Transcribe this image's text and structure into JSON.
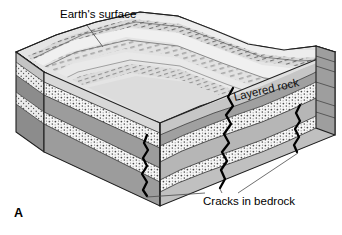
{
  "figure": {
    "panel_label": "A",
    "type": "geologic-block-diagram",
    "annotations": [
      {
        "name": "earths-surface",
        "text": "Earth's surface",
        "leader": "line from label down-right to ridged top surface"
      },
      {
        "name": "layered-rock",
        "text": "Layered rock",
        "leader": "none, placed on right block face, rotated with perspective"
      },
      {
        "name": "cracks-in-bedrock",
        "text": "Cracks in bedrock",
        "leader": "three thin lines fanning up to the three black cracks"
      }
    ],
    "colors": {
      "outline": "#1a1a1a",
      "crack": "#000000",
      "leader": "#4a4a4a",
      "top_surface_light": "#e8e8e8",
      "top_surface_shade": "#c9c9c9",
      "stipple_band": "#f4f4f4",
      "gray_band_front": "#9a9a9a",
      "gray_band_side": "#8a8a8a",
      "gray_band_right": "#b3b3b3",
      "pale_band_right": "#dedede",
      "background": "#ffffff"
    },
    "strata": [
      {
        "index": 0,
        "name": "surface-soil-layer",
        "fill": "light-gray"
      },
      {
        "index": 1,
        "name": "stippled-sand-layer-upper",
        "fill": "white-stipple"
      },
      {
        "index": 2,
        "name": "dark-rock-layer-upper",
        "fill": "medium-gray"
      },
      {
        "index": 3,
        "name": "stippled-sand-layer-lower",
        "fill": "white-stipple"
      },
      {
        "index": 4,
        "name": "dark-rock-layer-lower",
        "fill": "medium-gray"
      }
    ],
    "cracks": [
      {
        "index": 0,
        "name": "crack-left",
        "position": "front-left of right face"
      },
      {
        "index": 1,
        "name": "crack-center",
        "position": "center of right face, longest"
      },
      {
        "index": 2,
        "name": "crack-right",
        "position": "right edge of right face"
      }
    ]
  }
}
